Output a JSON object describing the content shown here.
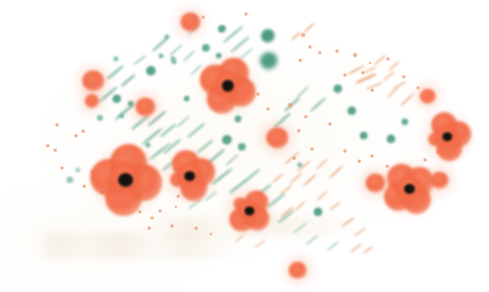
{
  "artwork": {
    "title": "Poppy Field",
    "medium": "blotted ink / stencil print",
    "background_color": "#ffffff",
    "paper_tint": "#fffefc",
    "canvas": {
      "width": 489,
      "height": 292
    },
    "palette": {
      "poppy_petal": "#F2683F",
      "poppy_petal_light": "#F78F68",
      "poppy_center": "#161110",
      "foliage_green": "#3E9478",
      "foliage_green_light": "#6FB49C",
      "stroke_orange": "#E8A074",
      "stroke_tan": "#D9B58C",
      "ghost_tan": "#EAD8C0"
    },
    "composition_note": "Elements cluster in a lens/oval band sweeping from lower-left to upper-right across a white field."
  },
  "poppies": [
    {
      "id": "poppy-center-large",
      "cx": 126,
      "cy": 180,
      "petal": 26,
      "core": 15,
      "lobes": 4,
      "rot": 8,
      "color": "#F2683F"
    },
    {
      "id": "poppy-center-mid",
      "cx": 190,
      "cy": 176,
      "petal": 19,
      "core": 11,
      "lobes": 3,
      "rot": -18,
      "color": "#F2683F"
    },
    {
      "id": "poppy-upper-center",
      "cx": 228,
      "cy": 86,
      "petal": 21,
      "core": 12,
      "lobes": 4,
      "rot": 25,
      "color": "#F2683F"
    },
    {
      "id": "poppy-lower-center",
      "cx": 249,
      "cy": 211,
      "petal": 17,
      "core": 10,
      "lobes": 3,
      "rot": 40,
      "color": "#F2683F"
    },
    {
      "id": "poppy-right-upper",
      "cx": 447,
      "cy": 137,
      "petal": 18,
      "core": 10,
      "lobes": 3,
      "rot": -12,
      "color": "#F2683F"
    },
    {
      "id": "poppy-right-lower",
      "cx": 409,
      "cy": 189,
      "petal": 20,
      "core": 11,
      "lobes": 4,
      "rot": 55,
      "color": "#F2683F"
    },
    {
      "id": "poppy-bud-left-upper",
      "cx": 93,
      "cy": 81,
      "petal": 11,
      "core": 0,
      "lobes": 1,
      "rot": 0,
      "color": "#F2683F"
    },
    {
      "id": "poppy-bud-left-lower",
      "cx": 92,
      "cy": 101,
      "petal": 7,
      "core": 0,
      "lobes": 1,
      "rot": 0,
      "color": "#F2683F"
    },
    {
      "id": "poppy-bud-left-mid",
      "cx": 145,
      "cy": 107,
      "petal": 10,
      "core": 0,
      "lobes": 1,
      "rot": 0,
      "color": "#F2683F"
    },
    {
      "id": "poppy-bud-top",
      "cx": 190,
      "cy": 22,
      "petal": 10,
      "core": 0,
      "lobes": 1,
      "rot": 0,
      "color": "#F2683F"
    },
    {
      "id": "poppy-bud-mid-right",
      "cx": 277,
      "cy": 138,
      "petal": 11,
      "core": 0,
      "lobes": 1,
      "rot": 0,
      "color": "#F2683F"
    },
    {
      "id": "poppy-bud-right-far",
      "cx": 428,
      "cy": 96,
      "petal": 8,
      "core": 0,
      "lobes": 1,
      "rot": 0,
      "color": "#F2683F"
    },
    {
      "id": "poppy-bud-right-pair-a",
      "cx": 375,
      "cy": 183,
      "petal": 10,
      "core": 0,
      "lobes": 1,
      "rot": 0,
      "color": "#F2683F"
    },
    {
      "id": "poppy-bud-right-pair-b",
      "cx": 440,
      "cy": 180,
      "petal": 9,
      "core": 0,
      "lobes": 1,
      "rot": 0,
      "color": "#F2683F"
    },
    {
      "id": "poppy-bud-bottom",
      "cx": 298,
      "cy": 270,
      "petal": 9,
      "core": 0,
      "lobes": 1,
      "rot": 0,
      "color": "#F2683F"
    }
  ],
  "foliage_dots": [
    {
      "cx": 268,
      "cy": 36,
      "r": 7.0,
      "color": "#3E9478"
    },
    {
      "cx": 269,
      "cy": 61,
      "r": 9.0,
      "color": "#3E9478"
    },
    {
      "cx": 222,
      "cy": 29,
      "r": 4.0,
      "color": "#4E9C82"
    },
    {
      "cx": 206,
      "cy": 48,
      "r": 4.0,
      "color": "#5AA38C"
    },
    {
      "cx": 219,
      "cy": 56,
      "r": 3.2,
      "color": "#5AA38C"
    },
    {
      "cx": 167,
      "cy": 37,
      "r": 2.6,
      "color": "#6FB49C"
    },
    {
      "cx": 151,
      "cy": 71,
      "r": 5.0,
      "color": "#4E9C82"
    },
    {
      "cx": 116,
      "cy": 59,
      "r": 2.6,
      "color": "#6FB49C"
    },
    {
      "cx": 161,
      "cy": 56,
      "r": 2.4,
      "color": "#6FB49C"
    },
    {
      "cx": 174,
      "cy": 62,
      "r": 2.4,
      "color": "#6FB49C"
    },
    {
      "cx": 117,
      "cy": 99,
      "r": 4.6,
      "color": "#4E9C82"
    },
    {
      "cx": 131,
      "cy": 104,
      "r": 3.2,
      "color": "#5AA38C"
    },
    {
      "cx": 187,
      "cy": 99,
      "r": 3.2,
      "color": "#5AA38C"
    },
    {
      "cx": 173,
      "cy": 59,
      "r": 2.4,
      "color": "#6FB49C"
    },
    {
      "cx": 100,
      "cy": 118,
      "r": 3.0,
      "color": "#6FB49C"
    },
    {
      "cx": 122,
      "cy": 116,
      "r": 2.6,
      "color": "#6FB49C"
    },
    {
      "cx": 238,
      "cy": 119,
      "r": 3.4,
      "color": "#5AA38C"
    },
    {
      "cx": 227,
      "cy": 140,
      "r": 5.0,
      "color": "#4E9C82"
    },
    {
      "cx": 242,
      "cy": 147,
      "r": 4.0,
      "color": "#5AA38C"
    },
    {
      "cx": 338,
      "cy": 89,
      "r": 4.6,
      "color": "#4E9C82"
    },
    {
      "cx": 352,
      "cy": 111,
      "r": 4.6,
      "color": "#4E9C82"
    },
    {
      "cx": 364,
      "cy": 136,
      "r": 4.2,
      "color": "#4E9C82"
    },
    {
      "cx": 391,
      "cy": 139,
      "r": 4.4,
      "color": "#4E9C82"
    },
    {
      "cx": 405,
      "cy": 122,
      "r": 3.6,
      "color": "#5AA38C"
    },
    {
      "cx": 318,
      "cy": 212,
      "r": 4.4,
      "color": "#4E9C82"
    },
    {
      "cx": 300,
      "cy": 165,
      "r": 2.6,
      "color": "#6FB49C"
    },
    {
      "cx": 70,
      "cy": 180,
      "r": 3.6,
      "color": "#8FC2AE"
    },
    {
      "cx": 78,
      "cy": 170,
      "r": 2.6,
      "color": "#9CCBB8"
    },
    {
      "cx": 148,
      "cy": 145,
      "r": 2.4,
      "color": "#6FB49C"
    }
  ],
  "orange_specks": [
    {
      "cx": 303,
      "cy": 35,
      "r": 2.4
    },
    {
      "cx": 310,
      "cy": 47,
      "r": 2.0
    },
    {
      "cx": 320,
      "cy": 53,
      "r": 2.2
    },
    {
      "cx": 337,
      "cy": 51,
      "r": 2.0
    },
    {
      "cx": 300,
      "cy": 60,
      "r": 1.8
    },
    {
      "cx": 355,
      "cy": 55,
      "r": 2.4
    },
    {
      "cx": 345,
      "cy": 75,
      "r": 2.0
    },
    {
      "cx": 363,
      "cy": 73,
      "r": 2.2
    },
    {
      "cx": 388,
      "cy": 59,
      "r": 2.0
    },
    {
      "cx": 404,
      "cy": 77,
      "r": 2.2
    },
    {
      "cx": 418,
      "cy": 88,
      "r": 2.0
    },
    {
      "cx": 372,
      "cy": 90,
      "r": 1.8
    },
    {
      "cx": 290,
      "cy": 105,
      "r": 2.4
    },
    {
      "cx": 268,
      "cy": 109,
      "r": 2.0
    },
    {
      "cx": 306,
      "cy": 117,
      "r": 2.2
    },
    {
      "cx": 330,
      "cy": 124,
      "r": 2.0
    },
    {
      "cx": 299,
      "cy": 131,
      "r": 2.2
    },
    {
      "cx": 312,
      "cy": 149,
      "r": 2.0
    },
    {
      "cx": 294,
      "cy": 158,
      "r": 1.8
    },
    {
      "cx": 345,
      "cy": 151,
      "r": 2.0
    },
    {
      "cx": 359,
      "cy": 161,
      "r": 1.8
    },
    {
      "cx": 372,
      "cy": 156,
      "r": 2.0
    },
    {
      "cx": 387,
      "cy": 166,
      "r": 1.8
    },
    {
      "cx": 425,
      "cy": 160,
      "r": 2.0
    },
    {
      "cx": 438,
      "cy": 152,
      "r": 1.8
    },
    {
      "cx": 370,
      "cy": 63,
      "r": 1.6
    },
    {
      "cx": 57,
      "cy": 125,
      "r": 2.0
    },
    {
      "cx": 76,
      "cy": 136,
      "r": 2.2
    },
    {
      "cx": 83,
      "cy": 131,
      "r": 1.8
    },
    {
      "cx": 48,
      "cy": 146,
      "r": 2.2
    },
    {
      "cx": 55,
      "cy": 150,
      "r": 1.8
    },
    {
      "cx": 62,
      "cy": 168,
      "r": 2.0
    },
    {
      "cx": 92,
      "cy": 172,
      "r": 2.0
    },
    {
      "cx": 84,
      "cy": 186,
      "r": 1.8
    },
    {
      "cx": 102,
      "cy": 192,
      "r": 1.8
    },
    {
      "cx": 140,
      "cy": 212,
      "r": 2.2
    },
    {
      "cx": 152,
      "cy": 218,
      "r": 2.0
    },
    {
      "cx": 160,
      "cy": 211,
      "r": 2.0
    },
    {
      "cx": 149,
      "cy": 228,
      "r": 1.8
    },
    {
      "cx": 172,
      "cy": 226,
      "r": 2.0
    },
    {
      "cx": 178,
      "cy": 196,
      "r": 1.8
    },
    {
      "cx": 196,
      "cy": 228,
      "r": 1.8
    },
    {
      "cx": 211,
      "cy": 234,
      "r": 1.6
    },
    {
      "cx": 176,
      "cy": 207,
      "r": 1.6
    },
    {
      "cx": 258,
      "cy": 94,
      "r": 2.0
    },
    {
      "cx": 246,
      "cy": 14,
      "r": 2.0
    },
    {
      "cx": 203,
      "cy": 17,
      "r": 1.8
    }
  ],
  "green_dashes": [
    {
      "x": 115,
      "y": 72,
      "len": 22,
      "th": 3.0,
      "rot": -40,
      "color": "#7FB8A4"
    },
    {
      "x": 128,
      "y": 80,
      "len": 18,
      "th": 2.6,
      "rot": -40,
      "color": "#7FB8A4"
    },
    {
      "x": 140,
      "y": 60,
      "len": 16,
      "th": 2.4,
      "rot": -38,
      "color": "#8FC2AE"
    },
    {
      "x": 160,
      "y": 44,
      "len": 20,
      "th": 2.6,
      "rot": -42,
      "color": "#7FB8A4"
    },
    {
      "x": 176,
      "y": 50,
      "len": 18,
      "th": 2.4,
      "rot": -42,
      "color": "#8FC2AE"
    },
    {
      "x": 189,
      "y": 56,
      "len": 16,
      "th": 2.2,
      "rot": -44,
      "color": "#8FC2AE"
    },
    {
      "x": 233,
      "y": 34,
      "len": 26,
      "th": 3.0,
      "rot": -40,
      "color": "#8FC2AE"
    },
    {
      "x": 240,
      "y": 44,
      "len": 24,
      "th": 2.8,
      "rot": -40,
      "color": "#8FC2AE"
    },
    {
      "x": 246,
      "y": 54,
      "len": 20,
      "th": 2.4,
      "rot": -40,
      "color": "#9CCBB8"
    },
    {
      "x": 193,
      "y": 30,
      "len": 14,
      "th": 2.2,
      "rot": -45,
      "color": "#9CCBB8"
    },
    {
      "x": 108,
      "y": 94,
      "len": 24,
      "th": 3.0,
      "rot": -40,
      "color": "#7FB8A4"
    },
    {
      "x": 125,
      "y": 112,
      "len": 26,
      "th": 3.2,
      "rot": -40,
      "color": "#7FB8A4"
    },
    {
      "x": 140,
      "y": 122,
      "len": 22,
      "th": 2.8,
      "rot": -40,
      "color": "#7FB8A4"
    },
    {
      "x": 157,
      "y": 118,
      "len": 24,
      "th": 3.0,
      "rot": -40,
      "color": "#7FB8A4"
    },
    {
      "x": 152,
      "y": 136,
      "len": 26,
      "th": 3.0,
      "rot": -40,
      "color": "#7FB8A4"
    },
    {
      "x": 168,
      "y": 130,
      "len": 20,
      "th": 2.6,
      "rot": -40,
      "color": "#8FC2AE"
    },
    {
      "x": 160,
      "y": 152,
      "len": 28,
      "th": 3.4,
      "rot": -38,
      "color": "#7FB8A4"
    },
    {
      "x": 172,
      "y": 146,
      "len": 22,
      "th": 2.8,
      "rot": -40,
      "color": "#8FC2AE"
    },
    {
      "x": 183,
      "y": 122,
      "len": 18,
      "th": 2.4,
      "rot": -42,
      "color": "#8FC2AE"
    },
    {
      "x": 196,
      "y": 130,
      "len": 22,
      "th": 2.6,
      "rot": -40,
      "color": "#8FC2AE"
    },
    {
      "x": 205,
      "y": 146,
      "len": 20,
      "th": 2.6,
      "rot": -40,
      "color": "#8FC2AE"
    },
    {
      "x": 216,
      "y": 156,
      "len": 22,
      "th": 2.8,
      "rot": -40,
      "color": "#7FB8A4"
    },
    {
      "x": 232,
      "y": 160,
      "len": 18,
      "th": 2.4,
      "rot": -42,
      "color": "#8FC2AE"
    },
    {
      "x": 222,
      "y": 176,
      "len": 26,
      "th": 3.0,
      "rot": -38,
      "color": "#7FB8A4"
    },
    {
      "x": 238,
      "y": 186,
      "len": 22,
      "th": 2.8,
      "rot": -38,
      "color": "#7FB8A4"
    },
    {
      "x": 252,
      "y": 175,
      "len": 20,
      "th": 2.6,
      "rot": -40,
      "color": "#8FC2AE"
    },
    {
      "x": 262,
      "y": 191,
      "len": 24,
      "th": 2.8,
      "rot": -38,
      "color": "#8FC2AE"
    },
    {
      "x": 276,
      "y": 200,
      "len": 22,
      "th": 2.6,
      "rot": -38,
      "color": "#8FC2AE"
    },
    {
      "x": 286,
      "y": 216,
      "len": 20,
      "th": 2.6,
      "rot": -38,
      "color": "#8FC2AE"
    },
    {
      "x": 300,
      "y": 228,
      "len": 18,
      "th": 2.4,
      "rot": -38,
      "color": "#9CCBB8"
    },
    {
      "x": 312,
      "y": 240,
      "len": 16,
      "th": 2.2,
      "rot": -38,
      "color": "#9CCBB8"
    },
    {
      "x": 282,
      "y": 120,
      "len": 22,
      "th": 2.6,
      "rot": -42,
      "color": "#7FB8A4"
    },
    {
      "x": 292,
      "y": 104,
      "len": 20,
      "th": 2.6,
      "rot": -42,
      "color": "#7FB8A4"
    },
    {
      "x": 303,
      "y": 92,
      "len": 18,
      "th": 2.4,
      "rot": -44,
      "color": "#8FC2AE"
    },
    {
      "x": 318,
      "y": 104,
      "len": 20,
      "th": 2.6,
      "rot": -42,
      "color": "#8FC2AE"
    },
    {
      "x": 196,
      "y": 70,
      "len": 16,
      "th": 2.2,
      "rot": -44,
      "color": "#9CCBB8"
    },
    {
      "x": 170,
      "y": 164,
      "len": 20,
      "th": 2.6,
      "rot": -38,
      "color": "#8FC2AE"
    },
    {
      "x": 195,
      "y": 204,
      "len": 18,
      "th": 2.4,
      "rot": -38,
      "color": "#9CCBB8"
    },
    {
      "x": 211,
      "y": 196,
      "len": 16,
      "th": 2.2,
      "rot": -40,
      "color": "#9CCBB8"
    },
    {
      "x": 333,
      "y": 246,
      "len": 14,
      "th": 2.2,
      "rot": -38,
      "color": "#9CCBB8"
    }
  ],
  "orange_dashes": [
    {
      "x": 296,
      "y": 36,
      "len": 12,
      "th": 2.2,
      "rot": -42,
      "color": "#E8A074"
    },
    {
      "x": 309,
      "y": 28,
      "len": 14,
      "th": 2.4,
      "rot": -44,
      "color": "#E8A074"
    },
    {
      "x": 356,
      "y": 70,
      "len": 20,
      "th": 2.4,
      "rot": -28,
      "color": "#E8A074"
    },
    {
      "x": 366,
      "y": 78,
      "len": 22,
      "th": 2.6,
      "rot": -24,
      "color": "#E8A074"
    },
    {
      "x": 374,
      "y": 86,
      "len": 18,
      "th": 2.2,
      "rot": -22,
      "color": "#ECB088"
    },
    {
      "x": 380,
      "y": 60,
      "len": 16,
      "th": 2.2,
      "rot": -40,
      "color": "#ECB088"
    },
    {
      "x": 394,
      "y": 66,
      "len": 14,
      "th": 2.0,
      "rot": -42,
      "color": "#ECB088"
    },
    {
      "x": 407,
      "y": 100,
      "len": 18,
      "th": 2.4,
      "rot": -44,
      "color": "#E8A074"
    },
    {
      "x": 393,
      "y": 92,
      "len": 16,
      "th": 2.2,
      "rot": -46,
      "color": "#ECB088"
    },
    {
      "x": 389,
      "y": 76,
      "len": 14,
      "th": 2.0,
      "rot": -40,
      "color": "#ECB088"
    },
    {
      "x": 292,
      "y": 158,
      "len": 20,
      "th": 2.4,
      "rot": -40,
      "color": "#E8A074"
    },
    {
      "x": 304,
      "y": 166,
      "len": 18,
      "th": 2.2,
      "rot": -40,
      "color": "#ECB088"
    },
    {
      "x": 296,
      "y": 178,
      "len": 16,
      "th": 2.2,
      "rot": -42,
      "color": "#ECB088"
    },
    {
      "x": 310,
      "y": 180,
      "len": 18,
      "th": 2.4,
      "rot": -42,
      "color": "#E8A074"
    },
    {
      "x": 322,
      "y": 164,
      "len": 16,
      "th": 2.2,
      "rot": -44,
      "color": "#ECB088"
    },
    {
      "x": 336,
      "y": 172,
      "len": 18,
      "th": 2.2,
      "rot": -44,
      "color": "#E8A074"
    },
    {
      "x": 286,
      "y": 190,
      "len": 16,
      "th": 2.2,
      "rot": -40,
      "color": "#ECB088"
    },
    {
      "x": 322,
      "y": 196,
      "len": 14,
      "th": 2.0,
      "rot": -42,
      "color": "#ECB088"
    },
    {
      "x": 287,
      "y": 212,
      "len": 16,
      "th": 2.2,
      "rot": -40,
      "color": "#E8A074"
    },
    {
      "x": 300,
      "y": 206,
      "len": 14,
      "th": 2.0,
      "rot": -42,
      "color": "#ECB088"
    },
    {
      "x": 278,
      "y": 178,
      "len": 14,
      "th": 2.0,
      "rot": -40,
      "color": "#ECB088"
    },
    {
      "x": 348,
      "y": 222,
      "len": 16,
      "th": 2.2,
      "rot": -36,
      "color": "#E8A074"
    },
    {
      "x": 360,
      "y": 232,
      "len": 14,
      "th": 2.0,
      "rot": -36,
      "color": "#ECB088"
    },
    {
      "x": 356,
      "y": 248,
      "len": 14,
      "th": 2.0,
      "rot": -36,
      "color": "#ECB088"
    },
    {
      "x": 368,
      "y": 250,
      "len": 12,
      "th": 2.0,
      "rot": -36,
      "color": "#ECB088"
    },
    {
      "x": 335,
      "y": 206,
      "len": 14,
      "th": 2.0,
      "rot": -38,
      "color": "#ECB088"
    },
    {
      "x": 260,
      "y": 244,
      "len": 14,
      "th": 2.0,
      "rot": -38,
      "color": "#EFC0A0"
    },
    {
      "x": 240,
      "y": 238,
      "len": 12,
      "th": 1.8,
      "rot": -38,
      "color": "#EFC0A0"
    },
    {
      "x": 370,
      "y": 70,
      "len": 14,
      "th": 2.0,
      "rot": -26,
      "color": "#ECB088"
    },
    {
      "x": 400,
      "y": 85,
      "len": 14,
      "th": 2.0,
      "rot": -30,
      "color": "#ECB088"
    }
  ]
}
